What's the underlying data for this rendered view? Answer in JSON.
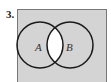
{
  "problem": {
    "number": "3.",
    "diagram_type": "venn",
    "universe_fill": "#d4d4d4",
    "shaded_region": "A ∩ B (unshaded/white); rest shaded gray",
    "sets": [
      {
        "label": "A"
      },
      {
        "label": "B"
      }
    ],
    "intersection_fill": "#ffffff",
    "outline_color": "#1a1a1a"
  }
}
